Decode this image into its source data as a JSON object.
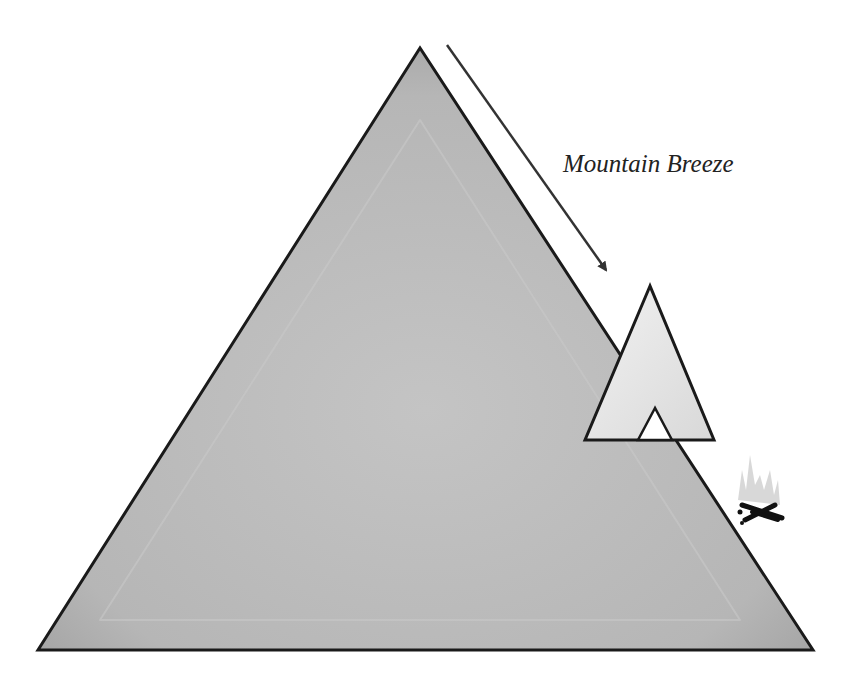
{
  "diagram": {
    "label": "Mountain Breeze",
    "elements": {
      "mountain": "large triangle mountain",
      "tent": "small tent on mountain slope",
      "campfire": "campfire at base of slope",
      "arrow": "wind arrow pointing downslope"
    },
    "colors": {
      "mountain_fill": "#b8b8b8",
      "mountain_outline": "#1a1a1a",
      "tent_fill": "#e6e6e6",
      "arrow": "#333333",
      "background": "#ffffff"
    }
  }
}
